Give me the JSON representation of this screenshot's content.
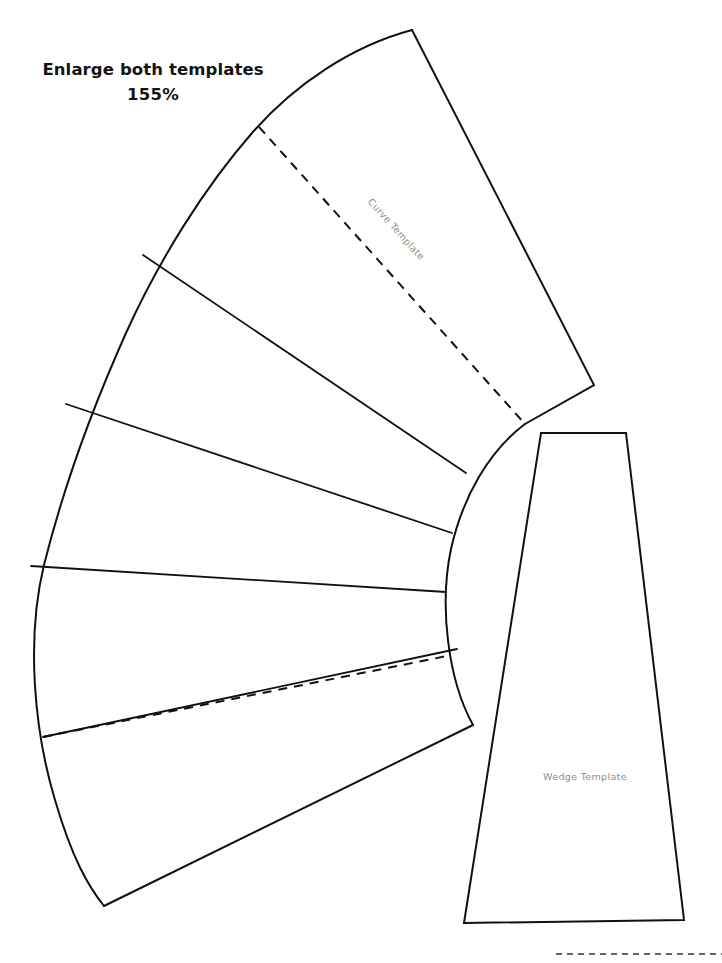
{
  "page": {
    "background_color": "#ffffff",
    "ink_color": "#111111",
    "label_color": "#8d8d8d"
  },
  "instructions": {
    "line1": "Enlarge both templates",
    "line2": "155%"
  },
  "shapes": {
    "curve_template": {
      "label": "Curve Template",
      "label_rotation_deg": 48,
      "description": "fan shaped arc template divided into six radial segments",
      "segment_count": 6,
      "dashed_guides": 2
    },
    "wedge_template": {
      "label": "Wedge Template",
      "description": "tapered trapezoid template"
    }
  },
  "bottom_rule": {
    "name": "dashed-trim-line",
    "style": "dashed"
  },
  "geometry": {
    "curve_outline": "M 412 30 L 594 385 L 525 424 L 473 725 L 104 906 L 30 565 L 143 255 Z",
    "curve_outer_arc": "M 412 30 C 300 60 210 140 143 255 C 80 365 36 468 30 565 C 25 670 58 800 104 906",
    "curve_inner_arc": "M 525 424 C 487 455 461 500 450 556 C 440 615 447 678 473 725",
    "curve_right_edge": "M 412 30 L 594 385 L 525 424",
    "curve_bottom_edge": "M 473 725 L 104 906",
    "segment_dividers": [
      "M 143 255 L 466 473",
      "M 66 404 L 451 533",
      "M 30 565 L 446 592",
      "M 43 737 L 456 650"
    ],
    "dashed_guides": [
      "M 259 127 L 525 424",
      "M 43 737 L 447 656"
    ],
    "wedge_outline": "M 541 433 L 626 433 L 684 920 L 464 923 Z",
    "bottom_dashed_rule": "M 556 954 L 722 954"
  }
}
